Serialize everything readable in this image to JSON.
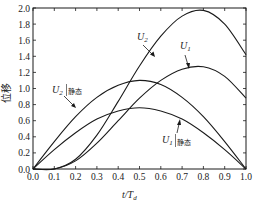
{
  "chart_data": {
    "type": "line",
    "title": "",
    "xlabel": "t/T_d",
    "ylabel": "位移",
    "xlim": [
      0.0,
      1.0
    ],
    "ylim": [
      0.0,
      2.0
    ],
    "grid": false,
    "legend": "inline annotations",
    "x_ticks": [
      "0.0",
      "0.1",
      "0.2",
      "0.3",
      "0.4",
      "0.5",
      "0.6",
      "0.7",
      "0.8",
      "0.9",
      "1.0"
    ],
    "y_ticks": [
      "0.0",
      "0.2",
      "0.4",
      "0.6",
      "0.8",
      "1.0",
      "1.2",
      "1.4",
      "1.6",
      "1.8",
      "2.0"
    ],
    "x": [
      0.0,
      0.1,
      0.2,
      0.3,
      0.4,
      0.5,
      0.6,
      0.7,
      0.8,
      0.9,
      1.0
    ],
    "series": [
      {
        "name": "U2",
        "values": [
          0.0,
          0.0,
          0.12,
          0.42,
          0.84,
          1.28,
          1.65,
          1.9,
          1.97,
          1.8,
          1.42
        ]
      },
      {
        "name": "U1",
        "values": [
          0.0,
          0.0,
          0.1,
          0.32,
          0.6,
          0.88,
          1.1,
          1.24,
          1.27,
          1.15,
          0.88
        ]
      },
      {
        "name": "U2|静态",
        "values": [
          0.0,
          0.34,
          0.65,
          0.89,
          1.04,
          1.1,
          1.05,
          0.89,
          0.65,
          0.34,
          0.0
        ]
      },
      {
        "name": "U1|静态",
        "values": [
          0.0,
          0.24,
          0.45,
          0.62,
          0.72,
          0.76,
          0.72,
          0.62,
          0.45,
          0.24,
          0.0
        ]
      }
    ],
    "annotations": [
      {
        "text": "U2",
        "near_x": 0.6,
        "near_y": 1.55
      },
      {
        "text": "U1",
        "near_x": 0.7,
        "near_y": 1.2
      },
      {
        "text": "U2|静态",
        "near_x": 0.22,
        "near_y": 0.9
      },
      {
        "text": "U1|静态",
        "near_x": 0.68,
        "near_y": 0.6
      }
    ]
  },
  "labels": {
    "ylabel": "位移",
    "xlabel_main": "t/T",
    "xlabel_sub": "d",
    "u2": "U",
    "u2_sub": "2",
    "u1": "U",
    "u1_sub": "1",
    "u2s": "U",
    "u2s_sub": "2",
    "u2s_cn": "静态",
    "u1s": "U",
    "u1s_sub": "1",
    "u1s_cn": "静态"
  }
}
